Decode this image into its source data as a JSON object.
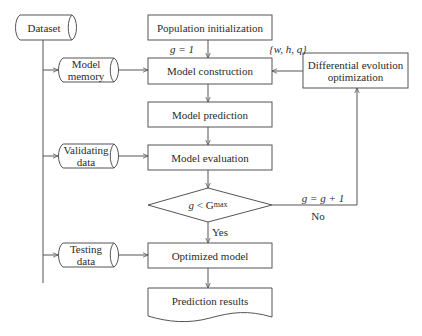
{
  "diagram": {
    "type": "flowchart",
    "nodes": {
      "dataset": {
        "label": "Dataset",
        "shape": "cylinder"
      },
      "model_memory": {
        "label_line1": "Model",
        "label_line2": "memory",
        "shape": "cylinder"
      },
      "validating_data": {
        "label_line1": "Validating",
        "label_line2": "data",
        "shape": "cylinder"
      },
      "testing_data": {
        "label_line1": "Testing",
        "label_line2": "data",
        "shape": "cylinder"
      },
      "population_init": {
        "label": "Population initialization",
        "shape": "rectangle"
      },
      "model_construction": {
        "label": "Model construction",
        "shape": "rectangle"
      },
      "model_prediction": {
        "label": "Model prediction",
        "shape": "rectangle"
      },
      "model_evaluation": {
        "label": "Model evaluation",
        "shape": "rectangle"
      },
      "decision": {
        "label_var": "g",
        "label_op": "<",
        "label_G": "G",
        "label_sub": "max",
        "shape": "diamond"
      },
      "optimized_model": {
        "label": "Optimized model",
        "shape": "rectangle"
      },
      "prediction_results": {
        "label": "Prediction results",
        "shape": "document"
      },
      "differential_evolution": {
        "label_line1": "Differential evolution",
        "label_line2": "optimization",
        "shape": "rectangle"
      }
    },
    "edge_labels": {
      "g_init": "g = 1",
      "params": "{w, h, q}",
      "g_increment": "g = g + 1",
      "no": "No",
      "yes": "Yes"
    },
    "colors": {
      "stroke": "#555555",
      "text": "#2b2b2b",
      "background": "#ffffff"
    }
  }
}
